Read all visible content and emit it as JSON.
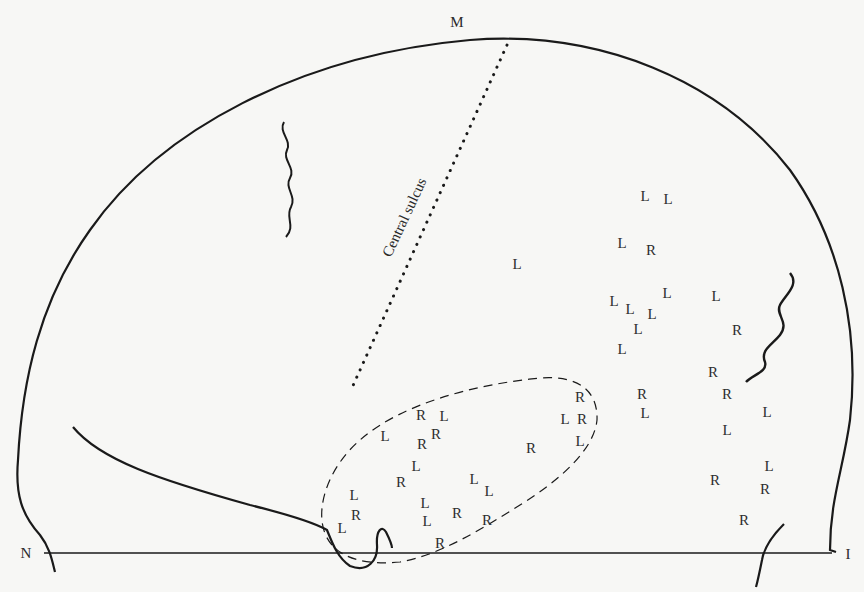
{
  "diagram": {
    "landmarks": {
      "top": "M",
      "left": "N",
      "right": "I"
    },
    "sulcus_label": "Central sulcus",
    "colors": {
      "ink": "#1a1a1a",
      "background": "#f7f7f5"
    },
    "points": [
      {
        "t": "L",
        "x": 645,
        "y": 196
      },
      {
        "t": "L",
        "x": 668,
        "y": 199
      },
      {
        "t": "L",
        "x": 622,
        "y": 243
      },
      {
        "t": "R",
        "x": 651,
        "y": 250
      },
      {
        "t": "L",
        "x": 517,
        "y": 264
      },
      {
        "t": "L",
        "x": 667,
        "y": 293
      },
      {
        "t": "L",
        "x": 716,
        "y": 296
      },
      {
        "t": "L",
        "x": 614,
        "y": 301
      },
      {
        "t": "L",
        "x": 630,
        "y": 309
      },
      {
        "t": "L",
        "x": 652,
        "y": 314
      },
      {
        "t": "L",
        "x": 638,
        "y": 329
      },
      {
        "t": "R",
        "x": 737,
        "y": 330
      },
      {
        "t": "L",
        "x": 622,
        "y": 349
      },
      {
        "t": "R",
        "x": 713,
        "y": 372
      },
      {
        "t": "R",
        "x": 642,
        "y": 394
      },
      {
        "t": "R",
        "x": 727,
        "y": 394
      },
      {
        "t": "L",
        "x": 645,
        "y": 413
      },
      {
        "t": "L",
        "x": 767,
        "y": 412
      },
      {
        "t": "L",
        "x": 727,
        "y": 430
      },
      {
        "t": "R",
        "x": 580,
        "y": 397
      },
      {
        "t": "L",
        "x": 565,
        "y": 419
      },
      {
        "t": "R",
        "x": 582,
        "y": 419
      },
      {
        "t": "L",
        "x": 580,
        "y": 441
      },
      {
        "t": "R",
        "x": 421,
        "y": 415
      },
      {
        "t": "L",
        "x": 444,
        "y": 416
      },
      {
        "t": "R",
        "x": 436,
        "y": 434
      },
      {
        "t": "L",
        "x": 385,
        "y": 436
      },
      {
        "t": "R",
        "x": 422,
        "y": 444
      },
      {
        "t": "R",
        "x": 531,
        "y": 448
      },
      {
        "t": "L",
        "x": 416,
        "y": 466
      },
      {
        "t": "R",
        "x": 401,
        "y": 482
      },
      {
        "t": "L",
        "x": 474,
        "y": 479
      },
      {
        "t": "L",
        "x": 489,
        "y": 491
      },
      {
        "t": "L",
        "x": 354,
        "y": 495
      },
      {
        "t": "R",
        "x": 356,
        "y": 515
      },
      {
        "t": "L",
        "x": 425,
        "y": 503
      },
      {
        "t": "R",
        "x": 457,
        "y": 513
      },
      {
        "t": "L",
        "x": 427,
        "y": 521
      },
      {
        "t": "R",
        "x": 487,
        "y": 520
      },
      {
        "t": "L",
        "x": 342,
        "y": 528
      },
      {
        "t": "R",
        "x": 440,
        "y": 543
      },
      {
        "t": "L",
        "x": 769,
        "y": 466
      },
      {
        "t": "R",
        "x": 715,
        "y": 480
      },
      {
        "t": "R",
        "x": 765,
        "y": 489
      },
      {
        "t": "R",
        "x": 744,
        "y": 520
      }
    ]
  }
}
